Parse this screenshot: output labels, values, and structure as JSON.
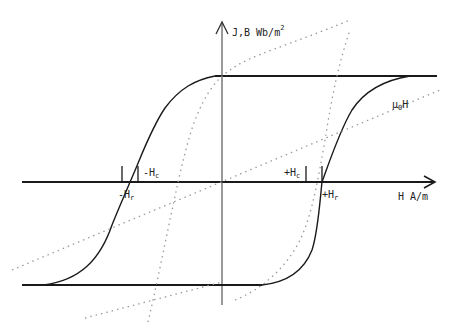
{
  "diagram": {
    "y_axis_label": "J,B Wb/m",
    "y_axis_label_sup": "2",
    "x_axis_label": "H  A/m",
    "labels": {
      "neg_hc": "-H",
      "neg_hc_sub": "c",
      "pos_hc": "+H",
      "pos_hc_sub": "c",
      "neg_hr": "-H",
      "neg_hr_sub": "r",
      "pos_hr": "+H",
      "pos_hr_sub": "r",
      "mu0h": "μ",
      "mu0h_sub": "0",
      "mu0h_tail": "H"
    },
    "colors": {
      "line": "#1a1a1a",
      "dotted": "#9a9a9a",
      "background": "#ffffff"
    }
  }
}
